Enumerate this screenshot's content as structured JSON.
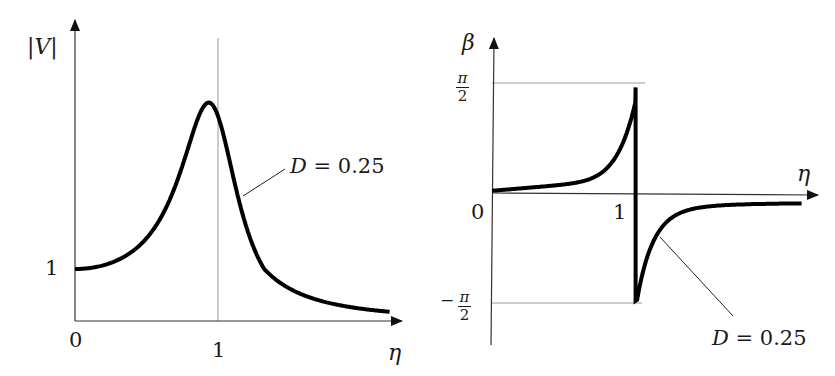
{
  "chart_data": [
    {
      "type": "line",
      "title": "",
      "xlabel": "η",
      "ylabel": "|V|",
      "x_ticks": [
        "0",
        "1"
      ],
      "y_ticks": [
        "1"
      ],
      "reference_lines": [
        {
          "axis": "x",
          "value": 1
        }
      ],
      "series": [
        {
          "name": "D = 0.25",
          "formula": "|V| = 1/sqrt((1-η²)² + (2Dη)²)",
          "D": 0.25,
          "x": [
            0,
            0.25,
            0.5,
            0.75,
            0.9,
            1.0,
            1.1,
            1.25,
            1.5,
            2.0,
            2.4
          ],
          "values": [
            1.0,
            1.06,
            1.28,
            1.9,
            3.0,
            4.2,
            3.0,
            1.9,
            1.0,
            0.45,
            0.3
          ]
        }
      ],
      "annotation": "D = 0.25",
      "grid": false
    },
    {
      "type": "line",
      "title": "",
      "xlabel": "η",
      "ylabel": "β",
      "x_ticks": [
        "0",
        "1"
      ],
      "y_ticks": [
        "π/2",
        "0",
        "−π/2"
      ],
      "ylim": [
        "-π/2",
        "π/2"
      ],
      "reference_lines": [
        {
          "axis": "y",
          "value": "π/2"
        },
        {
          "axis": "y",
          "value": "-π/2"
        }
      ],
      "series": [
        {
          "name": "D = 0.25",
          "D": 0.25,
          "x": [
            0,
            0.5,
            0.8,
            0.95,
            1.0,
            1.0,
            1.05,
            1.2,
            1.5,
            2.0,
            2.3
          ],
          "values": [
            0.0,
            0.12,
            0.35,
            0.85,
            1.3,
            -1.4,
            -1.0,
            -0.5,
            -0.25,
            -0.12,
            -0.09
          ]
        }
      ],
      "annotation": "D = 0.25",
      "grid": false
    }
  ],
  "left": {
    "ylabel_text": "|V|",
    "xlabel_text": "η",
    "x0_label": "0",
    "x1_label": "1",
    "y1_label": "1",
    "annotation_D": "D",
    "annotation_rest": "= 0.25",
    "D": 0.25,
    "peak_scale": 4.2
  },
  "right": {
    "ylabel_text": "β",
    "xlabel_text": "η",
    "zero_label": "0",
    "x1_label": "1",
    "pi_label": "π",
    "two_label": "2",
    "minus_label": "−",
    "annotation_D": "D",
    "annotation_rest": "= 0.25",
    "D": 0.25
  },
  "colors": {
    "curve": "#000000",
    "axis": "#333333",
    "guide": "#9a9a9a"
  }
}
